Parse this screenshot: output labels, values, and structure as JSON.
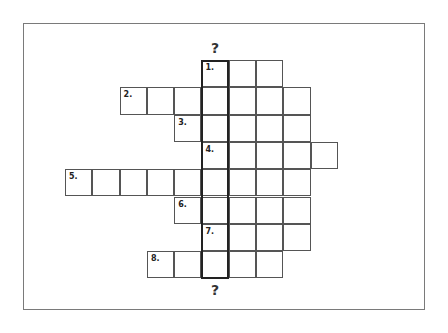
{
  "puzzle": {
    "type": "crossword",
    "key_column_marker_top": "?",
    "key_column_marker_bottom": "?",
    "key_column_index": 5,
    "rows": [
      {
        "number": "1.",
        "start_col": 5,
        "length": 3
      },
      {
        "number": "2.",
        "start_col": 2,
        "length": 7
      },
      {
        "number": "3.",
        "start_col": 4,
        "length": 5
      },
      {
        "number": "4.",
        "start_col": 5,
        "length": 5
      },
      {
        "number": "5.",
        "start_col": 0,
        "length": 9
      },
      {
        "number": "6.",
        "start_col": 4,
        "length": 5
      },
      {
        "number": "7.",
        "start_col": 5,
        "length": 4
      },
      {
        "number": "8.",
        "start_col": 3,
        "length": 5
      }
    ]
  }
}
